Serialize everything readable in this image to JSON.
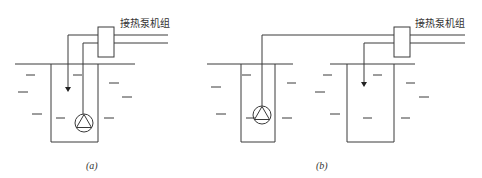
{
  "figure": {
    "panels": [
      {
        "id": "a",
        "caption": "(a)",
        "unit_label": "接热泵机组",
        "description": "Single well with submersible pump; supply and return pipes in same well"
      },
      {
        "id": "b",
        "caption": "(b)",
        "unit_label": "接热泵机组",
        "description": "Two wells: pumping well with submersible pump and separate recharge well"
      }
    ],
    "colors": {
      "line": "#3a3a3a",
      "background": "#ffffff"
    }
  }
}
